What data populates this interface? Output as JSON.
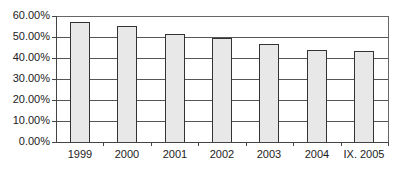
{
  "chart_data": {
    "type": "bar",
    "title": "",
    "xlabel": "",
    "ylabel": "",
    "categories": [
      "1999",
      "2000",
      "2001",
      "2002",
      "2003",
      "2004",
      "IX. 2005"
    ],
    "values": [
      57.0,
      55.3,
      51.4,
      49.7,
      46.7,
      44.0,
      43.4
    ],
    "unit": "%",
    "ylim": [
      0,
      60
    ],
    "yticks": [
      "0.00%",
      "10.00%",
      "20.00%",
      "30.00%",
      "40.00%",
      "50.00%",
      "60.00%"
    ],
    "grid": true,
    "legend": "none",
    "bar_color": "#e8e8e8",
    "bar_edge_color": "#333333"
  }
}
